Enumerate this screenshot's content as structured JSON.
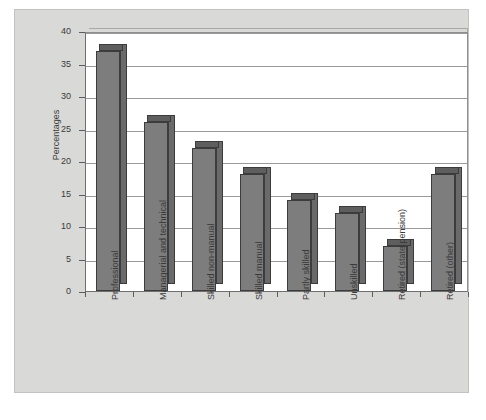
{
  "chart_data": {
    "type": "bar",
    "title": "",
    "subtitle": "",
    "xlabel": "",
    "ylabel": "Percentages",
    "ylim": [
      0,
      40
    ],
    "ytick_values": [
      0,
      5,
      10,
      15,
      20,
      25,
      30,
      35,
      40
    ],
    "ytick_labels": [
      "0",
      "5",
      "10",
      "15",
      "20",
      "25",
      "30",
      "35",
      "40"
    ],
    "grid": true,
    "legend": false,
    "legend_position": "none",
    "style": "3d-column",
    "categories": [
      "Professional",
      "Managerial and technical",
      "Skilled non-manual",
      "Skilled manual",
      "Partly skilled",
      "Unskilled",
      "Retired (state pension)",
      "Retired (other)"
    ],
    "values": [
      37,
      26,
      22,
      18,
      14,
      12,
      7,
      18
    ],
    "series": [
      {
        "name": "Percentages",
        "values": [
          37,
          26,
          22,
          18,
          14,
          12,
          7,
          18
        ]
      }
    ],
    "colors": {
      "bar_front": "#7d7d7d",
      "bar_side": "#6a6a6a",
      "bar_top": "#5e5e5e",
      "bar_outline": "#3c3c3c",
      "plot_background": "#ffffff",
      "panel_background": "#d9d9d7",
      "gridline": "#9a9a9a",
      "axis": "#5c5c5c",
      "text": "#3a3a3a"
    }
  }
}
